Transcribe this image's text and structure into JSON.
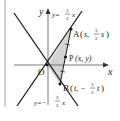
{
  "figure": {
    "colors": {
      "line": "#1a1a1a",
      "axis": "#555555",
      "shade": "#d3d3d3",
      "border": "#8a8a8a"
    },
    "axes": {
      "x_label": "x",
      "y_label": "y",
      "origin_label": "O"
    },
    "lines": [
      {
        "name": "y = 3/2 x",
        "label_lhs": "y=",
        "label_num": "3",
        "label_den": "2",
        "label_var": "x"
      },
      {
        "name": "y = -3/2 x",
        "label_lhs": "y=−",
        "label_num": "3",
        "label_den": "2",
        "label_var": "x"
      }
    ],
    "points": {
      "A": {
        "name": "A",
        "coord_open": "(",
        "coord_x": "s,",
        "coord_num": "3",
        "coord_den": "2",
        "coord_var": "s",
        "coord_close": ")"
      },
      "P": {
        "name": "P",
        "coord": "(x,  y)"
      },
      "B": {
        "name": "B",
        "coord_open": "(",
        "coord_x": "t, −",
        "coord_num": "3",
        "coord_den": "2",
        "coord_var": "t",
        "coord_close": ")"
      }
    },
    "shaded_region": "triangle OAB"
  }
}
